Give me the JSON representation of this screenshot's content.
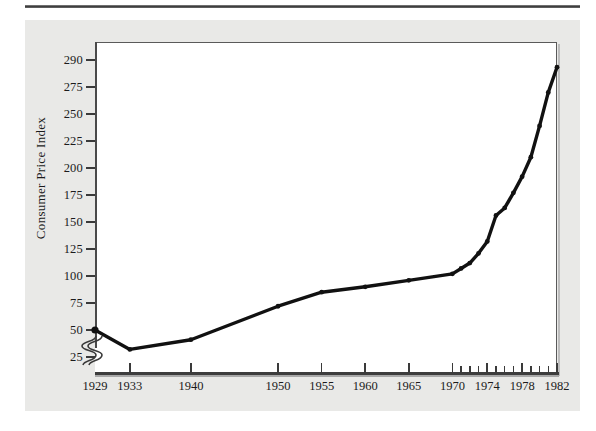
{
  "figure": {
    "background_color": "#e9e9e7",
    "plot_background_color": "#ffffff",
    "line_color": "#111111",
    "axis_color": "#3a3a3a"
  },
  "chart_data": {
    "type": "line",
    "title": "",
    "subtitle": "",
    "xlabel": "",
    "ylabel": "Consumer Price Index",
    "legend": [],
    "legend_position": "none",
    "grid": false,
    "axis_break": true,
    "axis_break_note": "y-axis broken below 25",
    "xlim": [
      1929,
      1982
    ],
    "ylim": [
      25,
      290
    ],
    "ytick_labels": [
      "290",
      "275",
      "250",
      "225",
      "200",
      "175",
      "150",
      "125",
      "100",
      "75",
      "50",
      "25"
    ],
    "ytick_values": [
      290,
      275,
      250,
      225,
      200,
      175,
      150,
      125,
      100,
      75,
      50,
      25
    ],
    "xtick_labels": [
      "1929",
      "1933",
      "1940",
      "1950",
      "1955",
      "1960",
      "1965",
      "1970",
      "1974",
      "1978",
      "1982"
    ],
    "xtick_values": [
      1929,
      1933,
      1940,
      1950,
      1955,
      1960,
      1965,
      1970,
      1974,
      1978,
      1982
    ],
    "xtick_minor_values": [
      1971,
      1972,
      1973,
      1974,
      1975,
      1976,
      1977,
      1978,
      1979,
      1980,
      1981,
      1982
    ],
    "x": [
      1929,
      1933,
      1940,
      1950,
      1955,
      1960,
      1965,
      1970,
      1971,
      1972,
      1973,
      1974,
      1975,
      1976,
      1977,
      1978,
      1979,
      1980,
      1981,
      1982
    ],
    "values": [
      50,
      32,
      41,
      72,
      85,
      90,
      96,
      102,
      107,
      112,
      121,
      132,
      156,
      163,
      177,
      192,
      210,
      239,
      270,
      286
    ],
    "series": [
      {
        "name": "Consumer Price Index",
        "x": [
          1929,
          1933,
          1940,
          1950,
          1955,
          1960,
          1965,
          1970,
          1971,
          1972,
          1973,
          1974,
          1975,
          1976,
          1977,
          1978,
          1979,
          1980,
          1981,
          1982
        ],
        "values": [
          50,
          32,
          41,
          72,
          85,
          90,
          96,
          102,
          107,
          112,
          121,
          132,
          156,
          163,
          177,
          192,
          210,
          239,
          270,
          286
        ]
      }
    ]
  }
}
